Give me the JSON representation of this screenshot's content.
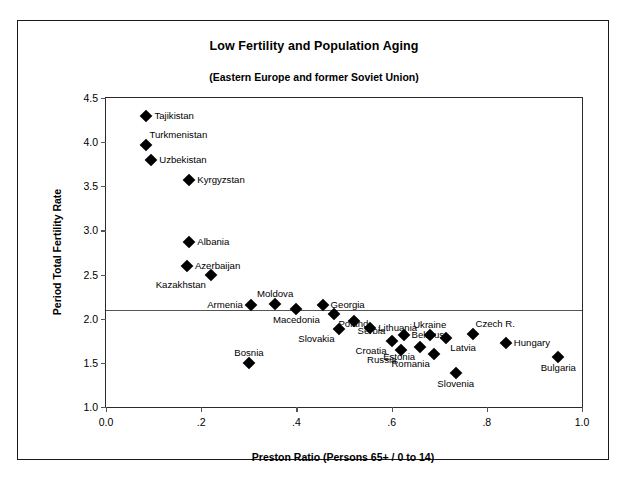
{
  "chart_data": {
    "type": "scatter",
    "title": "Low Fertility and Population Aging",
    "subtitle": "(Eastern Europe and former Soviet Union)",
    "xlabel": "Preston Ratio (Persons 65+ / 0 to 14)",
    "ylabel": "Period Total Fertility Rate",
    "xlim": [
      0.0,
      1.0
    ],
    "ylim": [
      1.0,
      4.5
    ],
    "xticks": [
      0.0,
      0.2,
      0.4,
      0.6,
      0.8,
      1.0
    ],
    "xticklabels": [
      "0.0",
      ".2",
      ".4",
      ".6",
      ".8",
      "1.0"
    ],
    "yticks": [
      1.0,
      1.5,
      2.0,
      2.5,
      3.0,
      3.5,
      4.0,
      4.5
    ],
    "yticklabels": [
      "1.0",
      "1.5",
      "2.0",
      "2.5",
      "3.0",
      "3.5",
      "4.0",
      "4.5"
    ],
    "grid": false,
    "legend": "none",
    "reference_line": {
      "axis": "y",
      "value": 2.1,
      "note": "replacement level fertility"
    },
    "marker": "filled-diamond",
    "points": [
      {
        "label": "Tajikistan",
        "x": 0.085,
        "y": 4.3,
        "label_pos": "right"
      },
      {
        "label": "Turkmenistan",
        "x": 0.085,
        "y": 3.97,
        "label_pos": "above-right"
      },
      {
        "label": "Uzbekistan",
        "x": 0.095,
        "y": 3.8,
        "label_pos": "right"
      },
      {
        "label": "Kyrgyzstan",
        "x": 0.175,
        "y": 3.57,
        "label_pos": "right"
      },
      {
        "label": "Albania",
        "x": 0.175,
        "y": 2.87,
        "label_pos": "right"
      },
      {
        "label": "Azerbaijan",
        "x": 0.17,
        "y": 2.6,
        "label_pos": "right"
      },
      {
        "label": "Kazakhstan",
        "x": 0.22,
        "y": 2.5,
        "label_pos": "below-left"
      },
      {
        "label": "Armenia",
        "x": 0.305,
        "y": 2.16,
        "label_pos": "left"
      },
      {
        "label": "Moldova",
        "x": 0.355,
        "y": 2.17,
        "label_pos": "above"
      },
      {
        "label": "Macedonia",
        "x": 0.4,
        "y": 2.11,
        "label_pos": "below"
      },
      {
        "label": "Georgia",
        "x": 0.455,
        "y": 2.15,
        "label_pos": "right"
      },
      {
        "label": "Poland",
        "x": 0.48,
        "y": 2.05,
        "label_pos": "below-right"
      },
      {
        "label": "Serbia",
        "x": 0.52,
        "y": 1.97,
        "label_pos": "below-right"
      },
      {
        "label": "Slovakia",
        "x": 0.49,
        "y": 1.88,
        "label_pos": "below-left"
      },
      {
        "label": "Lithuania",
        "x": 0.555,
        "y": 1.9,
        "label_pos": "right"
      },
      {
        "label": "Bosnia",
        "x": 0.3,
        "y": 1.5,
        "label_pos": "above"
      },
      {
        "label": "Croatia",
        "x": 0.6,
        "y": 1.75,
        "label_pos": "below-left"
      },
      {
        "label": "Belarus",
        "x": 0.625,
        "y": 1.81,
        "label_pos": "right"
      },
      {
        "label": "Russia",
        "x": 0.62,
        "y": 1.64,
        "label_pos": "below-left"
      },
      {
        "label": "Ukraine",
        "x": 0.68,
        "y": 1.82,
        "label_pos": "above"
      },
      {
        "label": "Estonia",
        "x": 0.66,
        "y": 1.68,
        "label_pos": "below-left"
      },
      {
        "label": "Romania",
        "x": 0.69,
        "y": 1.6,
        "label_pos": "below-left"
      },
      {
        "label": "Latvia",
        "x": 0.715,
        "y": 1.78,
        "label_pos": "below-right"
      },
      {
        "label": "Slovenia",
        "x": 0.735,
        "y": 1.39,
        "label_pos": "below"
      },
      {
        "label": "Czech R.",
        "x": 0.77,
        "y": 1.83,
        "label_pos": "above-right"
      },
      {
        "label": "Hungary",
        "x": 0.84,
        "y": 1.72,
        "label_pos": "right"
      },
      {
        "label": "Bulgaria",
        "x": 0.95,
        "y": 1.57,
        "label_pos": "below"
      }
    ]
  }
}
